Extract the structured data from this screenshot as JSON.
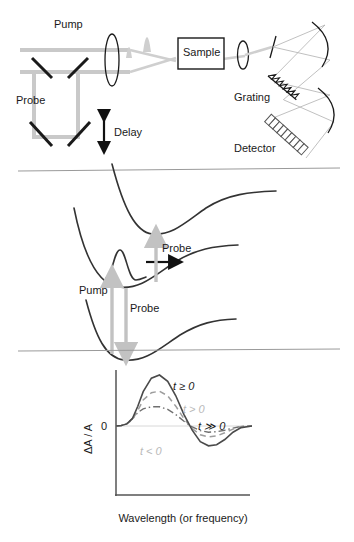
{
  "figure": {
    "background": "#ffffff"
  },
  "panel_setup": {
    "name": "optical-setup",
    "labels": {
      "pump": "Pump",
      "probe": "Probe",
      "delay": "Delay",
      "sample": "Sample",
      "grating": "Grating",
      "detector": "Detector"
    },
    "components": [
      "pump-beam",
      "probe-beam",
      "delay-stage-mirrors",
      "focusing-lens",
      "sample-cell",
      "collection-lens",
      "slit",
      "grating",
      "concave-mirrors",
      "detector-array"
    ]
  },
  "panel_pes": {
    "name": "potential-energy-surfaces",
    "labels": {
      "pump": "Pump",
      "probe_upper": "Probe",
      "probe_lower": "Probe"
    },
    "states": [
      "ground-state",
      "excited-state",
      "higher-excited-state"
    ],
    "wavepacket": "wavepacket-with-motion-arrow"
  },
  "chart_data": {
    "type": "line",
    "title": "",
    "xlabel": "Wavelength (or frequency)",
    "ylabel": "ΔA / A",
    "ytick_labels": [
      "0"
    ],
    "xtick_labels": [],
    "grid": false,
    "legend_position": "inline-annotations",
    "axis_ranges": {
      "xlim": [
        0,
        1
      ],
      "ylim": [
        -1,
        1
      ]
    },
    "annotations": [
      {
        "text": "t ≥ 0",
        "style": "italic-dark"
      },
      {
        "text": "t > 0",
        "style": "italic-light-gray"
      },
      {
        "text": "t ≫ 0",
        "style": "italic-dark"
      },
      {
        "text": "t < 0",
        "style": "italic-light-gray"
      }
    ],
    "series": [
      {
        "name": "t ≥ 0",
        "linestyle": "solid",
        "color": "#4a4a4a",
        "x": [
          0.0,
          0.04,
          0.08,
          0.12,
          0.16,
          0.2,
          0.26,
          0.32,
          0.38,
          0.44,
          0.5,
          0.56,
          0.62,
          0.68,
          0.74,
          0.8,
          0.86,
          0.92,
          1.0
        ],
        "values": [
          0.0,
          0.01,
          0.04,
          0.14,
          0.38,
          0.66,
          0.92,
          0.98,
          0.86,
          0.58,
          0.22,
          -0.08,
          -0.3,
          -0.38,
          -0.36,
          -0.26,
          -0.12,
          -0.03,
          0.0
        ]
      },
      {
        "name": "t > 0",
        "linestyle": "dashed",
        "color": "#9d9d9d",
        "x": [
          0.0,
          0.04,
          0.08,
          0.12,
          0.16,
          0.2,
          0.26,
          0.32,
          0.38,
          0.44,
          0.5,
          0.56,
          0.62,
          0.68,
          0.74,
          0.8,
          0.86,
          0.92,
          1.0
        ],
        "values": [
          0.0,
          0.01,
          0.04,
          0.12,
          0.3,
          0.5,
          0.64,
          0.67,
          0.58,
          0.38,
          0.14,
          -0.05,
          -0.17,
          -0.21,
          -0.19,
          -0.13,
          -0.06,
          -0.01,
          0.0
        ]
      },
      {
        "name": "t ≫ 0",
        "linestyle": "dashdot",
        "color": "#6f6f6f",
        "x": [
          0.0,
          0.04,
          0.08,
          0.12,
          0.16,
          0.2,
          0.26,
          0.32,
          0.38,
          0.44,
          0.5,
          0.56,
          0.62,
          0.68,
          0.74,
          0.8,
          0.86,
          0.92,
          1.0
        ],
        "values": [
          0.0,
          0.01,
          0.05,
          0.14,
          0.26,
          0.33,
          0.37,
          0.37,
          0.32,
          0.22,
          0.09,
          -0.02,
          -0.09,
          -0.12,
          -0.11,
          -0.08,
          -0.04,
          -0.01,
          0.0
        ]
      },
      {
        "name": "t < 0",
        "linestyle": "solid-flat",
        "color": "#d8d8d8",
        "x": [
          0.0,
          1.0
        ],
        "values": [
          0.0,
          0.0
        ]
      }
    ]
  }
}
